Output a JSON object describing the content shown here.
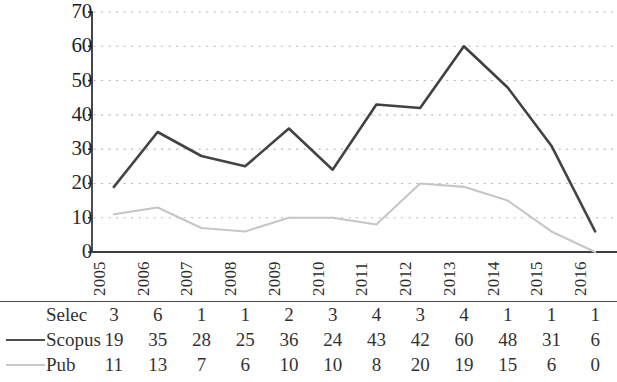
{
  "chart_data": {
    "type": "line",
    "title": "",
    "subtitle": "",
    "xlabel": "",
    "ylabel": "",
    "categories": [
      "2005",
      "2006",
      "2007",
      "2008",
      "2009",
      "2010",
      "2011",
      "2012",
      "2013",
      "2014",
      "2015",
      "2016"
    ],
    "ylim": [
      0,
      70
    ],
    "y_ticks": [
      0,
      10,
      20,
      30,
      40,
      50,
      60,
      70
    ],
    "y_tick_labels": [
      "0",
      "10",
      "20",
      "30",
      "40",
      "50",
      "60",
      "70"
    ],
    "grid": true,
    "grid_style": "dotted-horizontal",
    "legend_position": "table-left",
    "series": [
      {
        "name": "Selec",
        "values": [
          3,
          6,
          1,
          1,
          2,
          3,
          4,
          3,
          4,
          1,
          1,
          1
        ],
        "plotted": false,
        "line_color": "#ffffff",
        "swatch": "none"
      },
      {
        "name": "Scopus",
        "values": [
          19,
          35,
          28,
          25,
          36,
          24,
          43,
          42,
          60,
          48,
          31,
          6
        ],
        "plotted": true,
        "line_color": "#3c3c3c",
        "swatch": "solid"
      },
      {
        "name": "Pub",
        "values": [
          11,
          13,
          7,
          6,
          10,
          10,
          8,
          20,
          19,
          15,
          6,
          0
        ],
        "plotted": true,
        "line_color": "#c3c3c3",
        "swatch": "solid"
      }
    ]
  },
  "axes": {
    "axis_color": "#2f2f2f",
    "grid_color": "#b9b9b9"
  }
}
